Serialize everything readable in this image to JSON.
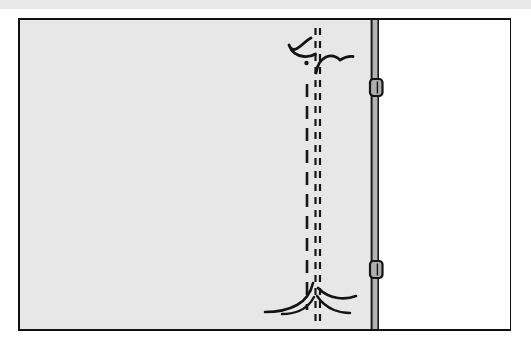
{
  "figure": {
    "frame": {
      "x": 18,
      "y": 18,
      "width": 493,
      "height": 313,
      "border_color": "#111111",
      "border_width": 2,
      "background_color": "#ffffff"
    },
    "top_band": {
      "x": 0,
      "y": 0,
      "width": 531,
      "height": 9,
      "color": "#e9e9e9"
    },
    "wall_panel": {
      "label": "shaded wall panel",
      "x": 20,
      "y": 20,
      "width": 351,
      "height": 309,
      "fill_color": "#e7e7e7"
    },
    "open_panel": {
      "label": "white panel right of post",
      "x": 379,
      "y": 20,
      "width": 130,
      "height": 309,
      "fill_color": "#ffffff"
    },
    "post": {
      "label": "vertical post",
      "x": 371,
      "y": 20,
      "width": 8,
      "height": 309,
      "fill_color": "#b4b4b4",
      "edge_color": "#1a1a1a"
    },
    "hinges": [
      {
        "label": "upper hinge",
        "x": 370,
        "y": 79,
        "width": 13,
        "height": 17,
        "fill_color": "#adadad",
        "edge_color": "#141414"
      },
      {
        "label": "lower hinge",
        "x": 370,
        "y": 261,
        "width": 13,
        "height": 17,
        "fill_color": "#adadad",
        "edge_color": "#141414"
      }
    ],
    "stem_lines": [
      {
        "label": "main stem long-dash line",
        "x": 307,
        "y_top": 84,
        "y_bottom": 310,
        "stroke_width": 2.6,
        "dash": "13 9",
        "color": "#171717"
      },
      {
        "label": "stem fine dashed line left",
        "x": 315.5,
        "y_top": 28,
        "y_bottom": 324,
        "stroke_width": 2.2,
        "dash": "7 6",
        "color": "#171717"
      },
      {
        "label": "stem fine dashed line right",
        "x": 320,
        "y_top": 28,
        "y_bottom": 324,
        "stroke_width": 2.2,
        "dash": "7 6",
        "color": "#171717"
      }
    ],
    "branches": [
      {
        "label": "upper-left curved branch",
        "color": "#141414",
        "stroke_width": 2.8
      },
      {
        "label": "upper-right curved branch",
        "color": "#141414",
        "stroke_width": 2.8
      },
      {
        "label": "bud mark dot",
        "color": "#141414"
      }
    ],
    "roots": [
      {
        "label": "root sweeping left",
        "color": "#141414",
        "stroke_width": 2.6
      },
      {
        "label": "root short left",
        "color": "#141414",
        "stroke_width": 2.4
      },
      {
        "label": "root short right",
        "color": "#141414",
        "stroke_width": 2.4
      },
      {
        "label": "root sweeping right",
        "color": "#141414",
        "stroke_width": 2.6
      }
    ]
  }
}
